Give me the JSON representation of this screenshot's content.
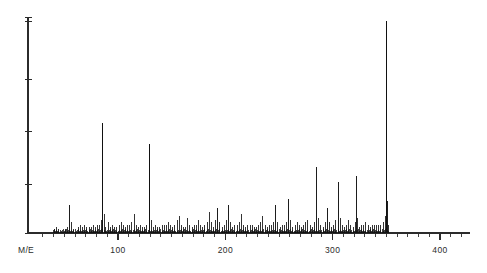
{
  "axes": {
    "y_axis_label": "",
    "x_axis_label": "M/E",
    "x_tick_labels": [
      "100",
      "200",
      "300",
      "400"
    ],
    "x_tick_values": [
      100,
      200,
      300,
      400
    ],
    "x_minor_step": 10,
    "y_tick_count": 5,
    "axis_color": "#2b2b2b"
  },
  "chart_data": {
    "type": "bar",
    "title": "",
    "subtitle": "",
    "xlabel": "M/E",
    "ylabel": "",
    "xlim": [
      20,
      440
    ],
    "ylim": [
      0,
      100
    ],
    "grid": false,
    "legend": null,
    "annotations": [],
    "series_name": "relative intensity",
    "x": [
      41,
      43,
      45,
      51,
      53,
      55,
      57,
      59,
      63,
      65,
      67,
      69,
      71,
      73,
      75,
      77,
      79,
      81,
      83,
      85,
      86,
      87,
      88,
      91,
      93,
      95,
      97,
      99,
      101,
      103,
      105,
      107,
      109,
      111,
      113,
      115,
      117,
      119,
      121,
      123,
      125,
      127,
      129,
      131,
      133,
      135,
      137,
      139,
      141,
      143,
      145,
      147,
      149,
      151,
      153,
      155,
      157,
      159,
      161,
      163,
      165,
      167,
      169,
      171,
      173,
      175,
      177,
      179,
      181,
      183,
      185,
      187,
      189,
      191,
      193,
      195,
      197,
      199,
      201,
      203,
      205,
      207,
      209,
      211,
      213,
      215,
      217,
      219,
      221,
      223,
      225,
      227,
      229,
      231,
      233,
      235,
      237,
      239,
      241,
      243,
      245,
      247,
      249,
      251,
      253,
      255,
      257,
      259,
      261,
      263,
      265,
      267,
      269,
      271,
      273,
      275,
      277,
      279,
      281,
      283,
      285,
      287,
      289,
      291,
      293,
      295,
      297,
      299,
      301,
      303,
      305,
      307,
      309,
      311,
      313,
      315,
      317,
      319,
      321,
      322,
      323,
      325,
      327,
      329,
      331,
      333,
      335,
      337,
      339,
      341,
      343,
      345,
      347,
      349,
      350,
      351,
      352
    ],
    "values": [
      2,
      3,
      2,
      2,
      3,
      13,
      5,
      2,
      3,
      4,
      3,
      4,
      3,
      3,
      3,
      4,
      3,
      4,
      4,
      6,
      52,
      9,
      3,
      5,
      3,
      4,
      3,
      3,
      4,
      5,
      4,
      3,
      4,
      4,
      5,
      9,
      4,
      3,
      4,
      3,
      3,
      4,
      42,
      6,
      3,
      4,
      3,
      3,
      4,
      4,
      4,
      5,
      4,
      3,
      4,
      6,
      8,
      4,
      3,
      3,
      7,
      4,
      3,
      4,
      4,
      6,
      4,
      3,
      4,
      5,
      10,
      5,
      3,
      6,
      12,
      5,
      3,
      4,
      6,
      13,
      5,
      3,
      4,
      4,
      5,
      9,
      4,
      3,
      4,
      4,
      4,
      3,
      3,
      4,
      5,
      8,
      4,
      3,
      4,
      4,
      5,
      13,
      5,
      3,
      4,
      4,
      5,
      16,
      6,
      3,
      4,
      5,
      4,
      3,
      4,
      5,
      6,
      4,
      3,
      5,
      31,
      7,
      4,
      3,
      5,
      12,
      5,
      3,
      4,
      6,
      24,
      7,
      4,
      3,
      4,
      6,
      4,
      3,
      5,
      27,
      7,
      3,
      4,
      4,
      5,
      4,
      3,
      4,
      4,
      4,
      4,
      4,
      5,
      8,
      100,
      15,
      4
    ],
    "base_peak_mz": 350,
    "base_peak_intensity": 100,
    "major_peaks": [
      {
        "mz": 55,
        "intensity": 13
      },
      {
        "mz": 86,
        "intensity": 52
      },
      {
        "mz": 129,
        "intensity": 42
      },
      {
        "mz": 193,
        "intensity": 12
      },
      {
        "mz": 203,
        "intensity": 13
      },
      {
        "mz": 247,
        "intensity": 13
      },
      {
        "mz": 259,
        "intensity": 16
      },
      {
        "mz": 285,
        "intensity": 31
      },
      {
        "mz": 295,
        "intensity": 12
      },
      {
        "mz": 305,
        "intensity": 24
      },
      {
        "mz": 322,
        "intensity": 27
      },
      {
        "mz": 350,
        "intensity": 100
      }
    ]
  }
}
